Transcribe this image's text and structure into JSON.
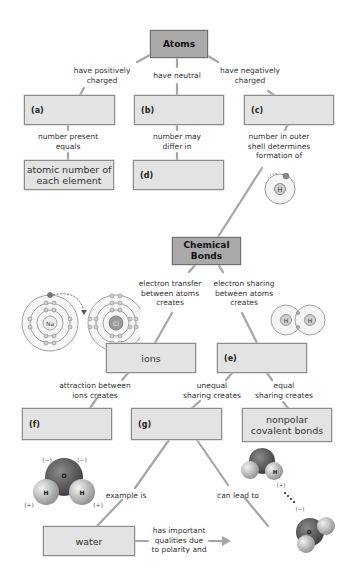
{
  "diagram": {
    "colors": {
      "box_fill": "#e3e3e3",
      "box_border": "#8c8c8c",
      "header_fill": "#a9a9a9",
      "connector": "#a6a6a6"
    },
    "nodes": {
      "atoms": "Atoms",
      "a": "(a)",
      "b": "(b)",
      "c": "(c)",
      "atomic_number": "atomic number of\neach element",
      "d": "(d)",
      "chemical_bonds": "Chemical\nBonds",
      "ions": "ions",
      "e": "(e)",
      "f": "(f)",
      "g": "(g)",
      "nonpolar": "nonpolar\ncovalent bonds",
      "water": "water",
      "h": "(h)"
    },
    "links": {
      "positively": "have positively\ncharged",
      "neutral": "have neutral",
      "negatively": "have negatively\ncharged",
      "number_present": "number present\nequals",
      "number_may": "number may\ndiffer in",
      "outer_shell": "number in outer\nshell determines\nformation of",
      "transfer": "electron transfer\nbetween atoms\ncreates",
      "sharing": "electron sharing\nbetween atoms\ncreates",
      "attraction": "attraction between\nions creates",
      "unequal": "unequal\nsharing creates",
      "equal": "equal\nsharing creates",
      "example": "example is",
      "lead_to": "can lead to",
      "qualities": "has important\nqualities due\nto polarity and"
    },
    "illustrations": {
      "h_atom": {
        "symbol": "H"
      },
      "nacl": {
        "left": "Na",
        "right": "Cl"
      },
      "h2": {
        "left": "H",
        "right": "H"
      },
      "water_molecule": {
        "o": "O",
        "h1": "H",
        "h2": "H",
        "neg1": "(−)",
        "neg2": "(−)",
        "pos1": "(+)",
        "pos2": "(+)"
      },
      "hydrogen_bond": {
        "h": "H",
        "o": "O",
        "pos": "(+)",
        "neg": "(−)"
      }
    }
  }
}
